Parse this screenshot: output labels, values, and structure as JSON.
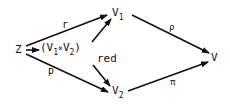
{
  "diagram": {
    "nodes": {
      "Z": {
        "label": "Z"
      },
      "prod": {
        "label_open": "(V",
        "sub1": "1",
        "times": "×",
        "label_mid": "V",
        "sub2": "2",
        "label_close": ")",
        "suffix": "red"
      },
      "V1": {
        "label": "V",
        "sub": "1"
      },
      "V2": {
        "label": "V",
        "sub": "2"
      },
      "V": {
        "label": "V"
      }
    },
    "edges": [
      {
        "from": "Z",
        "to": "V1",
        "label": "r"
      },
      {
        "from": "Z",
        "to": "V2",
        "label": "p"
      },
      {
        "from": "Z",
        "to": "prod",
        "label": ""
      },
      {
        "from": "prod",
        "to": "V1",
        "label": ""
      },
      {
        "from": "prod",
        "to": "V2",
        "label": ""
      },
      {
        "from": "V1",
        "to": "V",
        "label": "ρ"
      },
      {
        "from": "V2",
        "to": "V",
        "label": "π"
      }
    ]
  }
}
